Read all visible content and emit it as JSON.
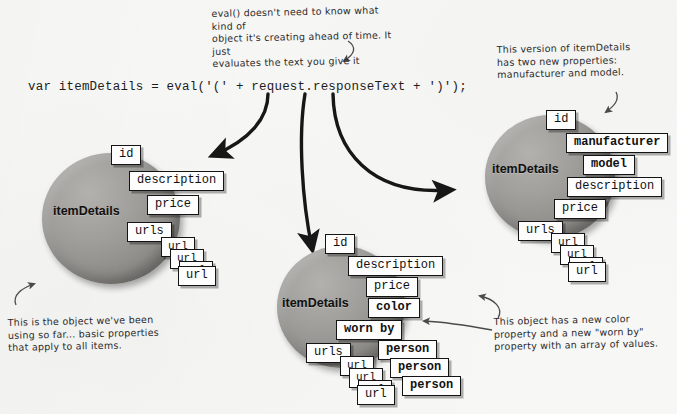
{
  "page": {
    "background_color": "#f7f7f6",
    "blob_color": "#9a9894",
    "box_color": "#fdfdfd",
    "ink_color": "#141414"
  },
  "code": {
    "line": "var itemDetails = eval('(' + request.responseText + ')');"
  },
  "annotations": {
    "eval_note": "eval() doesn't need to know what kind of\nobject it's creating ahead of time. It just\nevaluates the text you give it",
    "right_note": "This version of itemDetails\nhas two new properties:\nmanufacturer and model.",
    "left_note": "This is the object we've been\nusing so far... basic properties\nthat apply to all items.",
    "bottom_note": "This object has a new color\nproperty and a new \"worn by\"\nproperty with an array of values."
  },
  "objects": {
    "left": {
      "name": "itemDetails",
      "properties": [
        {
          "label": "id",
          "bold": false
        },
        {
          "label": "description",
          "bold": false
        },
        {
          "label": "price",
          "bold": false
        },
        {
          "label": "urls",
          "bold": false
        }
      ],
      "array_items": [
        {
          "label": "url"
        },
        {
          "label": "url"
        },
        {
          "label": "url"
        },
        {
          "label": "url"
        }
      ]
    },
    "middle": {
      "name": "itemDetails",
      "properties": [
        {
          "label": "id",
          "bold": false
        },
        {
          "label": "description",
          "bold": false
        },
        {
          "label": "price",
          "bold": false
        },
        {
          "label": "color",
          "bold": true
        },
        {
          "label": "worn by",
          "bold": true
        },
        {
          "label": "urls",
          "bold": false
        }
      ],
      "worn_by_items": [
        {
          "label": "person"
        },
        {
          "label": "person"
        },
        {
          "label": "person"
        }
      ],
      "array_items": [
        {
          "label": "url"
        },
        {
          "label": "url"
        },
        {
          "label": "url"
        },
        {
          "label": "url"
        }
      ]
    },
    "right": {
      "name": "itemDetails",
      "properties": [
        {
          "label": "id",
          "bold": false
        },
        {
          "label": "manufacturer",
          "bold": true
        },
        {
          "label": "model",
          "bold": true
        },
        {
          "label": "description",
          "bold": false
        },
        {
          "label": "price",
          "bold": false
        },
        {
          "label": "urls",
          "bold": false
        }
      ],
      "array_items": [
        {
          "label": "url"
        },
        {
          "label": "url"
        },
        {
          "label": "url"
        },
        {
          "label": "url"
        }
      ]
    }
  }
}
